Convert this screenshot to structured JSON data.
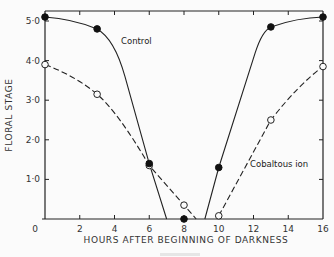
{
  "chart_data": {
    "type": "line",
    "title": "",
    "xlabel": "HOURS AFTER BEGINNING OF DARKNESS",
    "ylabel": "FLORAL STAGE",
    "xlim": [
      0,
      16
    ],
    "ylim": [
      0,
      5.2
    ],
    "xticks": [
      "0",
      "2",
      "4",
      "6",
      "8",
      "10",
      "12",
      "14",
      "16"
    ],
    "yticks": [
      "1·0",
      "2·0",
      "3·0",
      "4·0",
      "5·0"
    ],
    "grid": false,
    "series": [
      {
        "name": "Control",
        "marker": "filled-circle",
        "line": "solid",
        "x": [
          0,
          3,
          6,
          8,
          10,
          13,
          16
        ],
        "y": [
          5.1,
          4.8,
          1.4,
          0.0,
          1.3,
          4.85,
          5.1
        ],
        "line_path_note": "line drops to 0 near 7 h and rises from 0 near 9 h"
      },
      {
        "name": "Cobaltous ion",
        "marker": "open-circle",
        "line": "dashed",
        "x": [
          0,
          3,
          6,
          8,
          10,
          13,
          16
        ],
        "y": [
          3.9,
          3.15,
          1.35,
          0.35,
          0.08,
          2.5,
          3.85
        ]
      }
    ],
    "annotations": [
      "Control",
      "Cobaltous ion"
    ]
  }
}
